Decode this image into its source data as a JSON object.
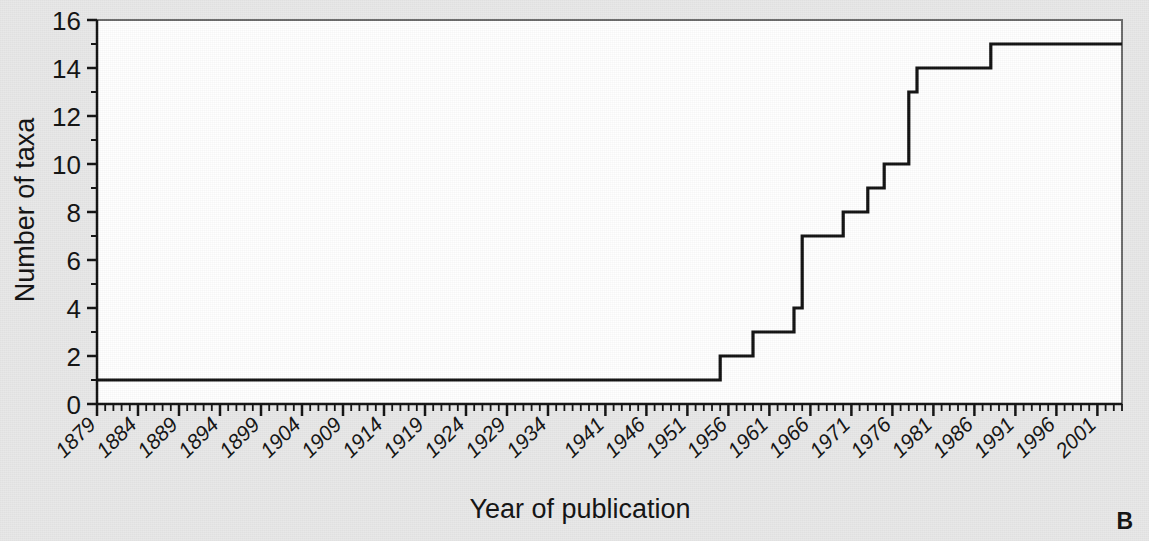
{
  "figure": {
    "panel_label": "B",
    "background_color": "#e8e8e8",
    "plot_background_color": "#ffffff",
    "line_color": "#111111"
  },
  "chart_data": {
    "type": "line",
    "title": "",
    "subtitle": "",
    "xlabel": "Year of publication",
    "ylabel": "Number of taxa",
    "xlim": [
      1879,
      2004
    ],
    "ylim": [
      0,
      16
    ],
    "grid": false,
    "legend": null,
    "step_style": "post",
    "y_ticks": [
      0,
      2,
      4,
      6,
      8,
      10,
      12,
      14,
      16
    ],
    "y_tick_labels": [
      "0",
      "2",
      "4",
      "6",
      "8",
      "10",
      "12",
      "14",
      "16"
    ],
    "y_minor_tick_interval": 1,
    "x_tick_labels": [
      "1879",
      "1884",
      "1889",
      "1894",
      "1899",
      "1904",
      "1909",
      "1914",
      "1919",
      "1924",
      "1929",
      "1934",
      "1941",
      "1946",
      "1951",
      "1956",
      "1961",
      "1966",
      "1971",
      "1976",
      "1981",
      "1986",
      "1991",
      "1996",
      "2001"
    ],
    "x_tick_values": [
      1879,
      1884,
      1889,
      1894,
      1899,
      1904,
      1909,
      1914,
      1919,
      1924,
      1929,
      1934,
      1941,
      1946,
      1951,
      1956,
      1961,
      1966,
      1971,
      1976,
      1981,
      1986,
      1991,
      1996,
      2001
    ],
    "x_minor_tick_interval": 1,
    "x": [
      1879,
      1954,
      1955,
      1958,
      1959,
      1963,
      1964,
      1965,
      1969,
      1970,
      1972,
      1973,
      1974,
      1975,
      1976,
      1978,
      1979,
      1987,
      1988,
      2004
    ],
    "y": [
      1,
      1,
      2,
      2,
      3,
      3,
      4,
      7,
      7,
      8,
      8,
      9,
      9,
      10,
      10,
      13,
      14,
      14,
      15,
      15
    ],
    "series": [
      {
        "name": "Cumulative number of taxa",
        "x": [
          1879,
          1954,
          1955,
          1958,
          1959,
          1963,
          1964,
          1965,
          1969,
          1970,
          1972,
          1973,
          1974,
          1975,
          1976,
          1978,
          1979,
          1987,
          1988,
          2004
        ],
        "values": [
          1,
          1,
          2,
          2,
          3,
          3,
          4,
          7,
          7,
          8,
          8,
          9,
          9,
          10,
          10,
          13,
          14,
          14,
          15,
          15
        ]
      }
    ],
    "annotations": [
      {
        "text": "B",
        "position": "bottom-right"
      }
    ]
  }
}
